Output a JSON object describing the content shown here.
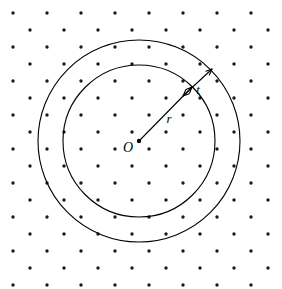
{
  "figure": {
    "type": "geometry-diagram",
    "canvas": {
      "width": 282,
      "height": 289,
      "background": "#ffffff"
    },
    "labels": {
      "center": "O",
      "radius": "r",
      "thickness": "t"
    },
    "geometry": {
      "center": {
        "x": 139,
        "y": 141
      },
      "inner_circle": {
        "radius": 76,
        "stroke": "#000000",
        "stroke_width": 1.1,
        "fill": "none"
      },
      "outer_circle": {
        "radius": 101,
        "stroke": "#000000",
        "stroke_width": 1.1,
        "fill": "none"
      },
      "radius_line": {
        "x1": 139,
        "y1": 141,
        "x2": 192,
        "y2": 87
      },
      "thickness_line": {
        "x1": 183,
        "y1": 96,
        "x2": 212,
        "y2": 69
      },
      "center_dot_radius": 2.2
    },
    "label_positions": {
      "center": {
        "x": 128,
        "y": 152
      },
      "radius": {
        "x": 169,
        "y": 123
      },
      "thickness": {
        "x": 198,
        "y": 94
      }
    },
    "background_grid": {
      "pattern": "staggered-dots",
      "dot_color": "#1a1a1a",
      "dot_radius": 1.7,
      "column_spacing": 34,
      "row_spacing": 17,
      "origin": {
        "x": 13,
        "y": 13
      },
      "row_offset": 17
    }
  }
}
